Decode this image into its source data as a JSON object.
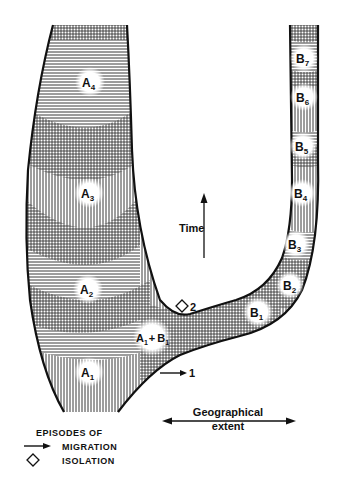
{
  "diagram": {
    "type": "phylogeographic lineage diagram",
    "axes": {
      "vertical_label": "Time",
      "horizontal_label_line1": "Geographical",
      "horizontal_label_line2": "extent"
    },
    "lineage_a": {
      "labels": [
        {
          "base": "A",
          "sub": "4"
        },
        {
          "base": "A",
          "sub": "3"
        },
        {
          "base": "A",
          "sub": "2"
        },
        {
          "base": "A",
          "sub": "1"
        }
      ]
    },
    "lineage_b": {
      "labels": [
        {
          "base": "B",
          "sub": "7"
        },
        {
          "base": "B",
          "sub": "6"
        },
        {
          "base": "B",
          "sub": "5"
        },
        {
          "base": "B",
          "sub": "4"
        },
        {
          "base": "B",
          "sub": "3"
        },
        {
          "base": "B",
          "sub": "2"
        },
        {
          "base": "B",
          "sub": "1"
        }
      ]
    },
    "junction": {
      "a_base": "A",
      "a_sub": "1",
      "plus": "+",
      "b_base": "B",
      "b_sub": "1"
    },
    "events": {
      "migration_marker": "1",
      "isolation_marker": "2"
    },
    "legend": {
      "title": "EPISODES OF",
      "items": [
        {
          "icon": "arrow-right-icon",
          "label": "MIGRATION"
        },
        {
          "icon": "diamond-icon",
          "label": "ISOLATION"
        }
      ]
    },
    "colors": {
      "ink": "#111111",
      "background": "#ffffff"
    }
  }
}
